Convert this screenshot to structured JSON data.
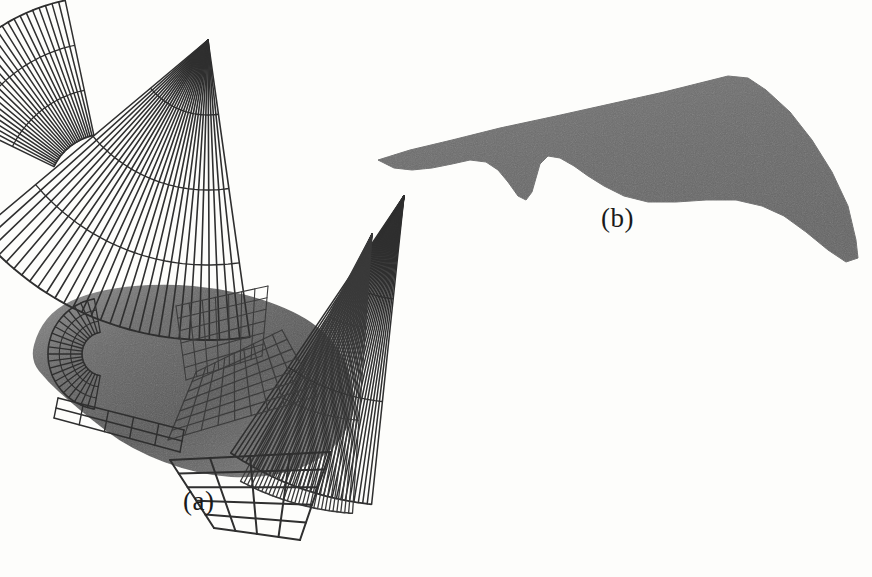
{
  "figure": {
    "caption_a": "(a)",
    "caption_b": "(b)",
    "background_color": "#fdfdfb",
    "ink_color": "#2b2b2b",
    "shade_dark": "#5d5d5d",
    "shade_mid": "#6f6f6f",
    "shade_light": "#8d8d8d",
    "solid_fill": "#6e6e6e",
    "width": 872,
    "height": 577
  },
  "chart_data": {
    "type": "diagram",
    "title": "",
    "xlabel": "",
    "ylabel": "",
    "subplots": [
      {
        "id": "a",
        "label": "(a)",
        "label_position": [
          183,
          486
        ],
        "description": "Wireframe surface mesh model of a blended wing-body aircraft with radial fan panels and a shaded fuselage",
        "render": "wireframe",
        "body": {
          "name": "shaded-fuselage",
          "fill_start": "#4e4e4e",
          "fill_end": "#8e8e8e",
          "outline": [
            [
              30,
              360
            ],
            [
              38,
              330
            ],
            [
              56,
              308
            ],
            [
              86,
              294
            ],
            [
              126,
              286
            ],
            [
              172,
              284
            ],
            [
              214,
              288
            ],
            [
              252,
              296
            ],
            [
              286,
              308
            ],
            [
              312,
              322
            ],
            [
              330,
              338
            ],
            [
              344,
              358
            ],
            [
              352,
              380
            ],
            [
              354,
              404
            ],
            [
              348,
              428
            ],
            [
              334,
              448
            ],
            [
              312,
              464
            ],
            [
              282,
              474
            ],
            [
              248,
              478
            ],
            [
              214,
              476
            ],
            [
              180,
              468
            ],
            [
              148,
              456
            ],
            [
              118,
              440
            ],
            [
              92,
              420
            ],
            [
              68,
              400
            ],
            [
              48,
              382
            ]
          ]
        },
        "panels": [
          {
            "name": "fan-left",
            "kind": "fan",
            "apex": [
              106,
              192
            ],
            "r_inner": 58,
            "r_outer": 196,
            "angle_start": 206,
            "angle_end": 258,
            "radial_lines": 26,
            "arc_lines": 2,
            "stroke": "#2f2f2f",
            "stroke_width": 1.5
          },
          {
            "name": "fan-center-top",
            "kind": "fan",
            "apex": [
              208,
              40
            ],
            "r_inner": 0,
            "r_outer": 300,
            "angle_start": 82,
            "angle_end": 140,
            "radial_lines": 30,
            "arc_lines": 3,
            "stroke": "#2f2f2f",
            "stroke_width": 1.6
          },
          {
            "name": "fan-right",
            "kind": "fan",
            "apex": [
              404,
              196
            ],
            "r_inner": 0,
            "r_outer": 310,
            "angle_start": 96,
            "angle_end": 124,
            "radial_lines": 34,
            "arc_lines": 2,
            "stroke": "#2f2f2f",
            "stroke_width": 1.5
          },
          {
            "name": "fan-right-inner",
            "kind": "fan",
            "apex": [
              372,
              234
            ],
            "r_inner": 0,
            "r_outer": 280,
            "angle_start": 94,
            "angle_end": 118,
            "radial_lines": 30,
            "arc_lines": 2,
            "stroke": "#3a3a3a",
            "stroke_width": 1.3
          },
          {
            "name": "mesh-bottom-grid",
            "kind": "quadgrid",
            "corners": [
              [
                170,
                460
              ],
              [
                330,
                452
              ],
              [
                300,
                540
              ],
              [
                214,
                528
              ]
            ],
            "rows": 5,
            "cols": 4,
            "stroke": "#2f2f2f",
            "stroke_width": 2.0
          },
          {
            "name": "mesh-body-lower",
            "kind": "quadgrid",
            "corners": [
              [
                168,
                440
              ],
              [
                318,
                396
              ],
              [
                282,
                330
              ],
              [
                196,
                372
              ]
            ],
            "rows": 7,
            "cols": 9,
            "stroke": "#3c3c3c",
            "stroke_width": 1.2
          },
          {
            "name": "mesh-body-upper",
            "kind": "quadgrid",
            "corners": [
              [
                176,
                306
              ],
              [
                268,
                286
              ],
              [
                262,
                356
              ],
              [
                186,
                380
              ]
            ],
            "rows": 6,
            "cols": 7,
            "stroke": "#3c3c3c",
            "stroke_width": 1.1
          },
          {
            "name": "mesh-nose-band",
            "kind": "fan",
            "apex": [
              104,
              354
            ],
            "r_inner": 22,
            "r_outer": 56,
            "angle_start": 100,
            "angle_end": 260,
            "radial_lines": 22,
            "arc_lines": 2,
            "stroke": "#2f2f2f",
            "stroke_width": 1.3
          },
          {
            "name": "mesh-belly-strip",
            "kind": "quadgrid",
            "corners": [
              [
                58,
                398
              ],
              [
                184,
                430
              ],
              [
                180,
                452
              ],
              [
                54,
                418
              ]
            ],
            "rows": 2,
            "cols": 5,
            "stroke": "#2f2f2f",
            "stroke_width": 1.4
          }
        ]
      },
      {
        "id": "b",
        "label": "(b)",
        "label_position": [
          601,
          203
        ],
        "description": "Solid shaded rendering of the same blended wing-body aircraft planform",
        "render": "solid",
        "body": {
          "name": "solid-planform",
          "fill": "#6e6e6e",
          "outline": [
            [
              378,
              160
            ],
            [
              410,
              150
            ],
            [
              452,
              140
            ],
            [
              500,
              128
            ],
            [
              556,
              116
            ],
            [
              610,
              104
            ],
            [
              664,
              92
            ],
            [
              704,
              82
            ],
            [
              728,
              76
            ],
            [
              748,
              78
            ],
            [
              766,
              90
            ],
            [
              790,
              112
            ],
            [
              812,
              140
            ],
            [
              832,
              172
            ],
            [
              848,
              206
            ],
            [
              856,
              240
            ],
            [
              858,
              258
            ],
            [
              846,
              262
            ],
            [
              828,
              250
            ],
            [
              806,
              232
            ],
            [
              784,
              216
            ],
            [
              762,
              206
            ],
            [
              736,
              200
            ],
            [
              706,
              200
            ],
            [
              676,
              202
            ],
            [
              648,
              202
            ],
            [
              624,
              196
            ],
            [
              604,
              186
            ],
            [
              588,
              176
            ],
            [
              574,
              166
            ],
            [
              560,
              158
            ],
            [
              548,
              156
            ],
            [
              540,
              164
            ],
            [
              536,
              178
            ],
            [
              532,
              192
            ],
            [
              526,
              200
            ],
            [
              518,
              196
            ],
            [
              508,
              182
            ],
            [
              498,
              170
            ],
            [
              486,
              162
            ],
            [
              470,
              160
            ],
            [
              452,
              164
            ],
            [
              432,
              168
            ],
            [
              412,
              170
            ],
            [
              394,
              168
            ]
          ]
        }
      }
    ]
  }
}
